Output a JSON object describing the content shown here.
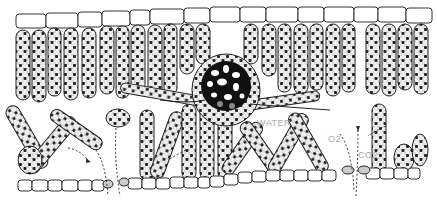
{
  "diagram": {
    "labels": {
      "water": "WATER",
      "oxygen": "O2",
      "carbon_dioxide": "CO2"
    },
    "colors": {
      "ink": "#1a1a1a",
      "label": "#aaaaaa",
      "background": "#ffffff"
    }
  }
}
